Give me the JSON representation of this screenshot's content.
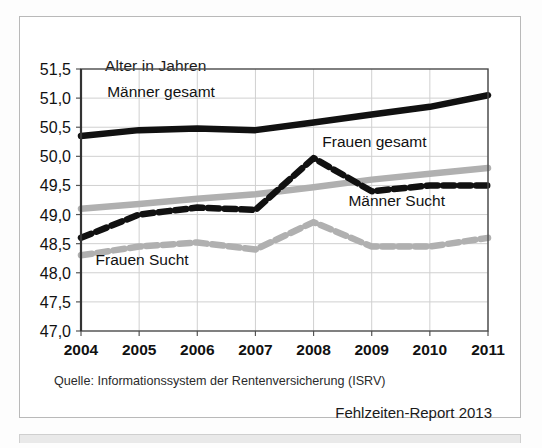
{
  "figure": {
    "axis_title": "Alter in Jahren",
    "source": "Quelle: Informationssystem der Rentenversicherung (ISRV)",
    "report": "Fehlzeiten-Report 2013"
  },
  "chart_data": {
    "type": "line",
    "title": "Alter in Jahren",
    "xlabel": "",
    "ylabel": "Alter in Jahren",
    "categories": [
      "2004",
      "2005",
      "2006",
      "2007",
      "2008",
      "2009",
      "2010",
      "2011"
    ],
    "ylim": [
      47.0,
      51.5
    ],
    "ytick_labels": [
      "47,0",
      "47,5",
      "48,0",
      "48,5",
      "49,0",
      "49,5",
      "50,0",
      "50,5",
      "51,0",
      "51,5"
    ],
    "ytick_values": [
      47.0,
      47.5,
      48.0,
      48.5,
      49.0,
      49.5,
      50.0,
      50.5,
      51.0,
      51.5
    ],
    "grid": true,
    "legend": "inline-labels",
    "series": [
      {
        "name": "Männer gesamt",
        "color": "#111111",
        "style": "solid",
        "label_x": 2004.45,
        "label_y": 51.02,
        "values": [
          50.35,
          50.45,
          50.48,
          50.45,
          50.58,
          50.72,
          50.85,
          51.05
        ]
      },
      {
        "name": "Frauen gesamt",
        "color": "#b0b0b0",
        "style": "solid",
        "label_x": 2008.15,
        "label_y": 50.16,
        "values": [
          49.1,
          49.18,
          49.27,
          49.35,
          49.47,
          49.6,
          49.7,
          49.8
        ]
      },
      {
        "name": "Männer Sucht",
        "color": "#111111",
        "style": "dashed",
        "label_x": 2008.6,
        "label_y": 49.14,
        "values": [
          48.6,
          49.0,
          49.12,
          49.08,
          49.97,
          49.4,
          49.5,
          49.5
        ]
      },
      {
        "name": "Frauen Sucht",
        "color": "#b0b0b0",
        "style": "dashed",
        "label_x": 2004.25,
        "label_y": 48.14,
        "values": [
          48.3,
          48.45,
          48.52,
          48.4,
          48.87,
          48.45,
          48.45,
          48.6
        ]
      }
    ]
  }
}
